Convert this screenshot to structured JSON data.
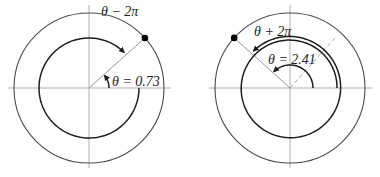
{
  "panels": [
    {
      "id": "left",
      "theta_value": 0.73,
      "theta_label": "θ = 0.73",
      "shifted_label": "θ − 2π",
      "shift": "-2π"
    },
    {
      "id": "right",
      "theta_value": 2.41,
      "theta_label": "θ = 2.41",
      "shifted_label": "θ + 2π",
      "shift": "+2π"
    }
  ],
  "colors": {
    "axis": "#9a9a9a",
    "curve": "#1e1e1e",
    "point": "#000000"
  }
}
